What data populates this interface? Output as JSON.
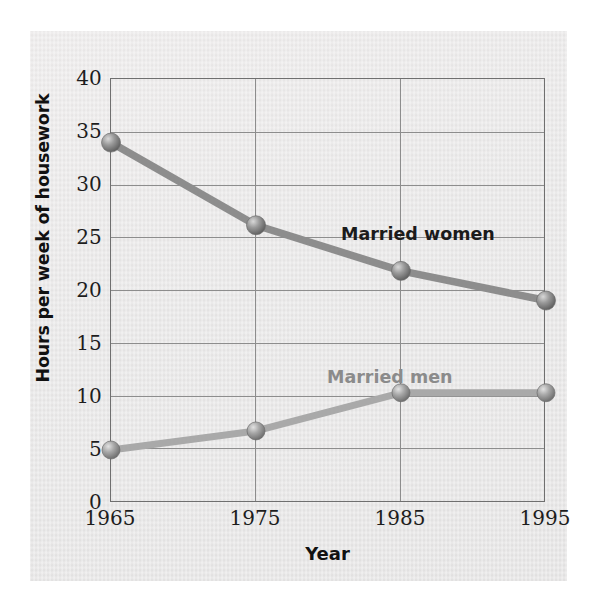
{
  "chart_data": {
    "type": "line",
    "title": "",
    "xlabel": "Year",
    "ylabel": "Hours per week of housework",
    "categories": [
      "1965",
      "1975",
      "1985",
      "1995"
    ],
    "x": [
      1965,
      1975,
      1985,
      1995
    ],
    "xlim": [
      1965,
      1995
    ],
    "ylim": [
      0,
      40
    ],
    "yticks": [
      "0",
      "5",
      "10",
      "15",
      "20",
      "25",
      "30",
      "35",
      "40"
    ],
    "ytick_values": [
      0,
      5,
      10,
      15,
      20,
      25,
      30,
      35,
      40
    ],
    "grid": "both",
    "legend": "inline-labels",
    "series": [
      {
        "name": "Married women",
        "values": [
          34.0,
          26.2,
          21.9,
          19.1
        ],
        "color": "#8d8d8d",
        "label_color": "#1b1b1b",
        "marker": "sphere"
      },
      {
        "name": "Married men",
        "values": [
          5.0,
          6.8,
          10.4,
          10.4
        ],
        "color": "#a9a9a9",
        "label_color": "#8b8b8b",
        "marker": "sphere"
      }
    ]
  },
  "axis": {
    "y_title": "Hours per week of housework",
    "x_title": "Year"
  },
  "colors": {
    "page_background": "#e7e6e6",
    "plot_border": "#6f6f6f",
    "gridline": "#8d8d8d",
    "women_line": "#8d8d8d",
    "men_line": "#a9a9a9",
    "tick_text": "#1d1d1d"
  }
}
